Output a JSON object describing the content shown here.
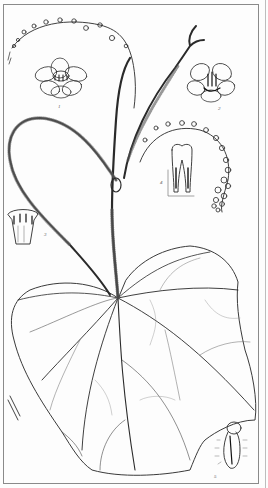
{
  "plate": {
    "subject": "botanical illustration",
    "description": "Climbing hairy vine with large cordate palmately-veined leaf, tendrils, flowering racemes and floral detail figures",
    "colors": {
      "ink": "#2a2a2a",
      "paper": "#fdfdfd",
      "frame": "#8a8a8a"
    }
  },
  "figures": [
    {
      "id": "flower-front",
      "label": "1"
    },
    {
      "id": "flower-open",
      "label": "2"
    },
    {
      "id": "stamen-tube",
      "label": "3"
    },
    {
      "id": "corolla-section",
      "label": "4"
    },
    {
      "id": "fruit-hairy",
      "label": "5"
    }
  ]
}
